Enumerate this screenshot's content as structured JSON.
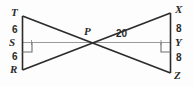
{
  "figure": {
    "background_color": "#fdfdfd",
    "stroke_color": "#2b2b2b",
    "thin_stroke_color": "#8a8a8a",
    "vertices": {
      "T": "T",
      "S": "S",
      "R": "R",
      "P": "P",
      "X": "X",
      "Y": "Y",
      "Z": "Z"
    },
    "measures": {
      "ts": "6",
      "sr": "6",
      "xy": "8",
      "yz": "8",
      "py": "20"
    },
    "right_angle_marks": [
      "right-angle-at-S",
      "right-angle-at-Y"
    ],
    "segments": [
      "T-R vertical left side",
      "X-Z vertical right side",
      "S-Y horizontal transversal through P",
      "T-Z diagonal through P",
      "R-X diagonal through P"
    ]
  }
}
